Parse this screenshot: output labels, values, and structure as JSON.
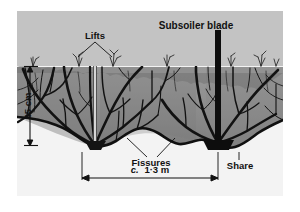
{
  "figure": {
    "kind": "cross-section-diagram",
    "frame_color": "#ffffff",
    "panel_color": "#c3c3c3",
    "subsoil_color": "#f2f2f2",
    "soil_color": "#8e8e8e",
    "ink_color": "#111111"
  },
  "labels": {
    "blade": "Subsoiler blade",
    "lifts": "Lifts",
    "fissures": "Fissures",
    "share": "Share"
  },
  "dimensions": {
    "depth": {
      "text": "45 cm",
      "orientation": "vertical",
      "value": 45,
      "unit": "cm"
    },
    "width": {
      "prefix": "c.",
      "text": "1·3 m",
      "full_text": "c. 1·3 m",
      "value_range": [
        1,
        3
      ],
      "unit": "m",
      "orientation": "horizontal"
    }
  }
}
